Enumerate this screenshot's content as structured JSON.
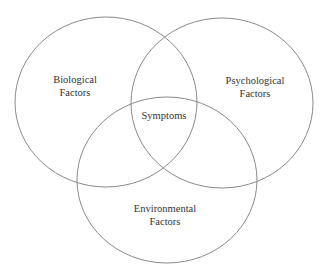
{
  "diagram": {
    "type": "venn",
    "stroke_color": "#8a8a8a",
    "background": "#ffffff",
    "sets": [
      {
        "id": "biological",
        "line1": "Biological",
        "line2": "Factors"
      },
      {
        "id": "psychological",
        "line1": "Psychological",
        "line2": "Factors"
      },
      {
        "id": "environmental",
        "line1": "Environmental",
        "line2": "Factors"
      }
    ],
    "intersection": {
      "label": "Symptoms"
    }
  }
}
